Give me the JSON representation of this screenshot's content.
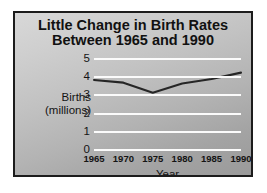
{
  "chart_data": {
    "type": "line",
    "title": "Little Change in Birth Rates Between 1965 and 1990",
    "title_lines": [
      "Little Change in Birth Rates",
      "Between 1965 and 1990"
    ],
    "xlabel": "Year",
    "ylabel": "Births (millions)",
    "ylabel_lines": [
      "Births",
      "(millions)"
    ],
    "categories": [
      1965,
      1970,
      1975,
      1980,
      1985,
      1990
    ],
    "x_tick_labels": [
      "1965",
      "1970",
      "1975",
      "1980",
      "1985",
      "1990"
    ],
    "values": [
      3.85,
      3.7,
      3.15,
      3.65,
      3.9,
      4.25
    ],
    "series": [
      {
        "name": "Births (millions)",
        "values": [
          3.85,
          3.7,
          3.15,
          3.65,
          3.9,
          4.25
        ]
      }
    ],
    "ylim": [
      0,
      5
    ],
    "y_ticks": [
      5,
      4,
      3,
      2,
      1,
      0
    ],
    "y_tick_labels": [
      "5",
      "4",
      "3",
      "2",
      "1",
      "0"
    ],
    "xlim": [
      1965,
      1990
    ],
    "grid": true,
    "grid_axis": "y",
    "legend": false,
    "legend_position": "none",
    "colors": {
      "line": "#262626",
      "gridline": "#fbfbfb",
      "text": "#141414",
      "title": "#111111",
      "frame_border": "#1c1c1c",
      "plot_background_light": "#d8d8d8",
      "plot_background_dark": "#9a9a9a",
      "page_background": "#ffffff"
    }
  }
}
